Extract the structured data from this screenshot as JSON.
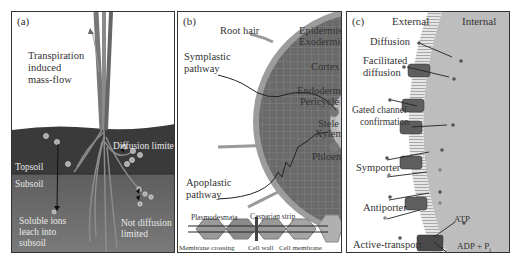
{
  "figure": {
    "panels": [
      {
        "id": "a",
        "tag": "(a)",
        "labels": {
          "transpiration": [
            "Transpiration",
            "induced",
            "mass-flow"
          ],
          "diffusion_limited": "Diffusion limited",
          "topsoil": "Topsoil",
          "subsoil": "Subsoil",
          "soluble_ions": [
            "Soluble ions",
            "leach into",
            "subsoil"
          ],
          "not_diffusion_limited": [
            "Not diffusion",
            "limited"
          ]
        }
      },
      {
        "id": "b",
        "tag": "(b)",
        "labels": {
          "root_hair": "Root hair",
          "epidermis": "Epidermis",
          "exodermis": "Exodermis",
          "cortex": "Cortex",
          "endodermis": "Endodermis",
          "pericycle": "Pericycle",
          "stele": "Stele",
          "xylem": "Xylem",
          "phloem": "Phloem",
          "symplastic": [
            "Symplastic",
            "pathway"
          ],
          "apoplastic": [
            "Apoplastic",
            "pathway"
          ],
          "plasmodesmata": "Plasmodesmata",
          "casparian_strip": "Casparian strip",
          "membrane_crossing": "Membrane crossing",
          "cell_wall": "Cell wall",
          "cell_membrane": "Cell membrane"
        }
      },
      {
        "id": "c",
        "tag": "(c)",
        "labels": {
          "external": "External",
          "internal": "Internal",
          "diffusion": "Diffusion",
          "facilitated": [
            "Facilitated",
            "diffusion"
          ],
          "gated": [
            "Gated channel",
            "confirmation"
          ],
          "symporter": "Symporter",
          "antiporter": "Antiporter",
          "active_transport": "Active-transport",
          "atp": "ATP",
          "adp": "ADP + P",
          "adp_sub": "i"
        }
      }
    ],
    "colors": {
      "sky": "#ffffff",
      "topsoil": "#3c3c3c",
      "subsoil": "#5a5a5a",
      "root": "#8a8a8a",
      "cortex": "#6e6e6e",
      "epidermis": "#9a9a9a",
      "stele": "#b8b8b8",
      "internal": "#bdbdbd",
      "membrane": "#d8d8d8",
      "protein": "#5c5c5c"
    }
  }
}
